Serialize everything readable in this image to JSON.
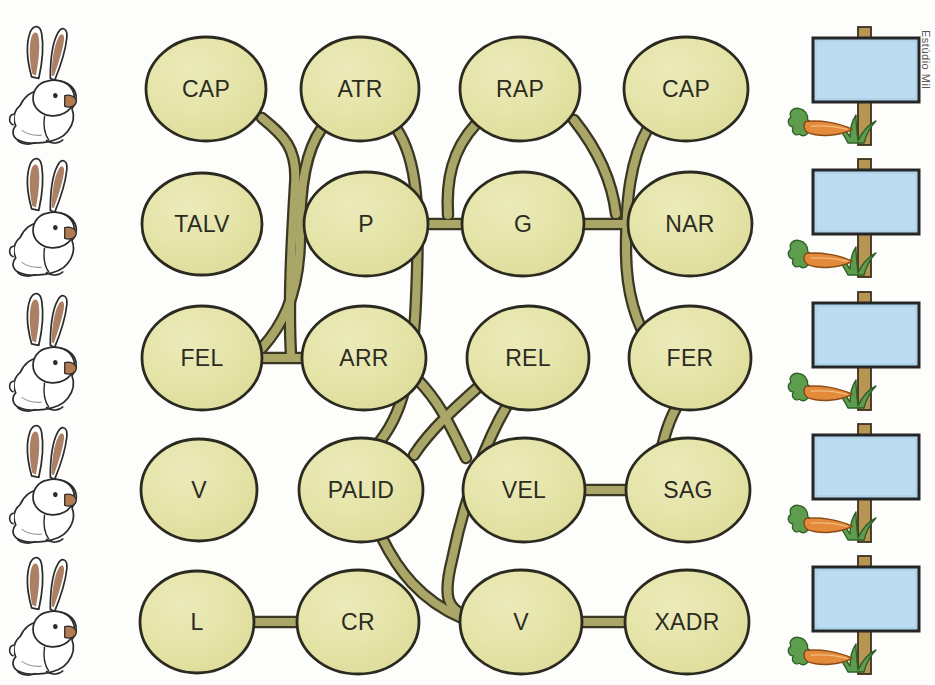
{
  "page": {
    "credit": "Estúdio Mil",
    "background_color": "#fdfdfb"
  },
  "palette": {
    "node_fill": "#e3e2a4",
    "node_fill_light": "#eae9b8",
    "node_stroke": "#2b2a20",
    "path_fill": "#a9a667",
    "path_stroke": "#3a3722",
    "sign_board": "#aed3ea",
    "sign_board_stroke": "#262626",
    "post_color": "#b79553",
    "carrot_color": "#e38b3b",
    "leaf_color": "#5f9d4e",
    "grass_color": "#5f9d4e",
    "rabbit_body": "#ffffff",
    "rabbit_ear_inner": "#9c6a4a",
    "rabbit_outline": "#2b2b2b"
  },
  "nodes": [
    {
      "id": "r1c1",
      "label": "CAP",
      "row": 1,
      "col": 1,
      "cx": 206,
      "cy": 89,
      "rx": 60,
      "ry": 52
    },
    {
      "id": "r1c2",
      "label": "ATR",
      "row": 1,
      "col": 2,
      "cx": 360,
      "cy": 89,
      "rx": 59,
      "ry": 52
    },
    {
      "id": "r1c3",
      "label": "RAP",
      "row": 1,
      "col": 3,
      "cx": 520,
      "cy": 89,
      "rx": 60,
      "ry": 52
    },
    {
      "id": "r1c4",
      "label": "CAP",
      "row": 1,
      "col": 4,
      "cx": 686,
      "cy": 89,
      "rx": 62,
      "ry": 52
    },
    {
      "id": "r2c1",
      "label": "TALV",
      "row": 2,
      "col": 1,
      "cx": 202,
      "cy": 224,
      "rx": 60,
      "ry": 51
    },
    {
      "id": "r2c2",
      "label": "P",
      "row": 2,
      "col": 2,
      "cx": 366,
      "cy": 224,
      "rx": 62,
      "ry": 52
    },
    {
      "id": "r2c3",
      "label": "G",
      "row": 2,
      "col": 3,
      "cx": 523,
      "cy": 224,
      "rx": 61,
      "ry": 52
    },
    {
      "id": "r2c4",
      "label": "NAR",
      "row": 2,
      "col": 4,
      "cx": 690,
      "cy": 224,
      "rx": 62,
      "ry": 52
    },
    {
      "id": "r3c1",
      "label": "FEL",
      "row": 3,
      "col": 1,
      "cx": 202,
      "cy": 358,
      "rx": 60,
      "ry": 52
    },
    {
      "id": "r3c2",
      "label": "ARR",
      "row": 3,
      "col": 2,
      "cx": 364,
      "cy": 358,
      "rx": 62,
      "ry": 52
    },
    {
      "id": "r3c3",
      "label": "REL",
      "row": 3,
      "col": 3,
      "cx": 528,
      "cy": 358,
      "rx": 61,
      "ry": 52
    },
    {
      "id": "r3c4",
      "label": "FER",
      "row": 3,
      "col": 4,
      "cx": 690,
      "cy": 358,
      "rx": 61,
      "ry": 52
    },
    {
      "id": "r4c1",
      "label": "V",
      "row": 4,
      "col": 1,
      "cx": 199,
      "cy": 490,
      "rx": 58,
      "ry": 51
    },
    {
      "id": "r4c2",
      "label": "PALID",
      "row": 4,
      "col": 2,
      "cx": 361,
      "cy": 490,
      "rx": 62,
      "ry": 52
    },
    {
      "id": "r4c3",
      "label": "VEL",
      "row": 4,
      "col": 3,
      "cx": 524,
      "cy": 490,
      "rx": 61,
      "ry": 52
    },
    {
      "id": "r4c4",
      "label": "SAG",
      "row": 4,
      "col": 4,
      "cx": 688,
      "cy": 490,
      "rx": 62,
      "ry": 52
    },
    {
      "id": "r5c1",
      "label": "L",
      "row": 5,
      "col": 1,
      "cx": 197,
      "cy": 622,
      "rx": 57,
      "ry": 51
    },
    {
      "id": "r5c2",
      "label": "CR",
      "row": 5,
      "col": 2,
      "cx": 358,
      "cy": 622,
      "rx": 61,
      "ry": 52
    },
    {
      "id": "r5c3",
      "label": "V",
      "row": 5,
      "col": 3,
      "cx": 521,
      "cy": 622,
      "rx": 61,
      "ry": 52
    },
    {
      "id": "r5c4",
      "label": "XADR",
      "row": 5,
      "col": 4,
      "cx": 687,
      "cy": 622,
      "rx": 62,
      "ry": 52
    }
  ],
  "connectors": [
    {
      "from": "r1c1",
      "to": "r2c2",
      "style": "crossing-curve"
    },
    {
      "from": "r1c2",
      "to": "r3c1",
      "style": "long-curve"
    },
    {
      "from": "r1c2",
      "to": "r4c2",
      "style": "long-curve"
    },
    {
      "from": "r1c3",
      "to": "r2c3",
      "style": "curve"
    },
    {
      "from": "r1c3",
      "to": "r2c4",
      "style": "curve"
    },
    {
      "from": "r1c4",
      "to": "r3c4",
      "style": "long-curve"
    },
    {
      "from": "r2c2",
      "to": "r2c3",
      "style": "straight"
    },
    {
      "from": "r2c3",
      "to": "r2c4",
      "style": "straight"
    },
    {
      "from": "r3c1",
      "to": "r3c2",
      "style": "straight"
    },
    {
      "from": "r3c2",
      "to": "r4c3",
      "style": "curve"
    },
    {
      "from": "r3c3",
      "to": "r4c2",
      "style": "curve"
    },
    {
      "from": "r3c3",
      "to": "r5c3",
      "style": "long-curve"
    },
    {
      "from": "r3c4",
      "to": "r4c4",
      "style": "curve"
    },
    {
      "from": "r4c2",
      "to": "r5c3",
      "style": "long-curve"
    },
    {
      "from": "r4c3",
      "to": "r4c4",
      "style": "straight"
    },
    {
      "from": "r5c1",
      "to": "r5c2",
      "style": "straight"
    },
    {
      "from": "r5c3",
      "to": "r5c4",
      "style": "straight"
    }
  ],
  "rabbits": [
    {
      "index": 1,
      "x": 10,
      "y": 25
    },
    {
      "index": 2,
      "x": 10,
      "y": 157
    },
    {
      "index": 3,
      "x": 10,
      "y": 292
    },
    {
      "index": 4,
      "x": 10,
      "y": 424
    },
    {
      "index": 5,
      "x": 10,
      "y": 556
    }
  ],
  "signposts": [
    {
      "index": 1,
      "x": 800,
      "y": 25,
      "board_text": ""
    },
    {
      "index": 2,
      "x": 800,
      "y": 157,
      "board_text": ""
    },
    {
      "index": 3,
      "x": 800,
      "y": 290,
      "board_text": ""
    },
    {
      "index": 4,
      "x": 800,
      "y": 422,
      "board_text": ""
    },
    {
      "index": 5,
      "x": 800,
      "y": 554,
      "board_text": ""
    }
  ],
  "icons": {
    "rabbit": "rabbit-icon",
    "signpost": "signpost-icon",
    "carrot": "carrot-icon",
    "grass": "grass-icon"
  }
}
